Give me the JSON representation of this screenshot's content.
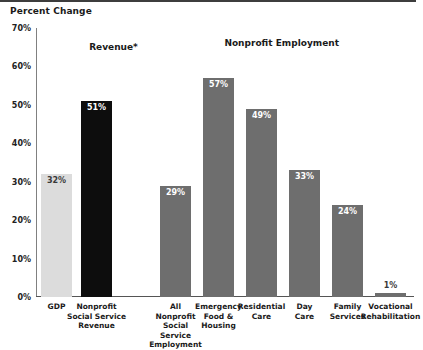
{
  "chart": {
    "title": "Percent Change",
    "type": "bar"
  },
  "chart_data": {
    "type": "bar",
    "title": "Percent Change",
    "xlabel": "",
    "ylabel": "Percent Change",
    "ylim": [
      0,
      70
    ],
    "ytick_labels": [
      "0%",
      "10%",
      "20%",
      "30%",
      "40%",
      "50%",
      "60%",
      "70%"
    ],
    "ytick_values": [
      0,
      10,
      20,
      30,
      40,
      50,
      60,
      70
    ],
    "grid": false,
    "legend_position": "none",
    "group_headers": [
      {
        "label": "Revenue*",
        "center_pct": 20.5
      },
      {
        "label": "Nonprofit Employment",
        "center_pct": 65.0
      }
    ],
    "groups": [
      {
        "name": "Revenue*",
        "bars": [
          {
            "category": "GDP",
            "value": 32,
            "label": "32%",
            "color": "#dcdcdc",
            "label_color": "#3a3a3a",
            "label_placement": "inside"
          },
          {
            "category": "Nonprofit Social Service Revenue",
            "value": 51,
            "label": "51%",
            "color": "#0d0d0d",
            "label_color": "#ffffff",
            "label_placement": "inside"
          }
        ]
      },
      {
        "name": "Nonprofit Employment",
        "bars": [
          {
            "category": "All Nonprofit Social Service Employment",
            "value": 29,
            "label": "29%",
            "color": "#6e6e6e",
            "label_color": "#ffffff",
            "label_placement": "inside"
          },
          {
            "category": "Emergency Food & Housing",
            "value": 57,
            "label": "57%",
            "color": "#6e6e6e",
            "label_color": "#ffffff",
            "label_placement": "inside"
          },
          {
            "category": "Residential Care",
            "value": 49,
            "label": "49%",
            "color": "#6e6e6e",
            "label_color": "#ffffff",
            "label_placement": "inside"
          },
          {
            "category": "Day Care",
            "value": 33,
            "label": "33%",
            "color": "#6e6e6e",
            "label_color": "#ffffff",
            "label_placement": "inside"
          },
          {
            "category": "Family Services",
            "value": 24,
            "label": "24%",
            "color": "#6e6e6e",
            "label_color": "#ffffff",
            "label_placement": "inside"
          },
          {
            "category": "Vocational Rehabilitation",
            "value": 1,
            "label": "1%",
            "color": "#6e6e6e",
            "label_color": "#3a3a3a",
            "label_placement": "above"
          }
        ]
      }
    ],
    "categories": [
      "GDP",
      "Nonprofit Social Service Revenue",
      "All Nonprofit Social Service Employment",
      "Emergency Food & Housing",
      "Residential Care",
      "Day Care",
      "Family Services",
      "Vocational Rehabilitation"
    ],
    "values": [
      32,
      51,
      29,
      57,
      49,
      33,
      24,
      1
    ],
    "colors": [
      "#dcdcdc",
      "#0d0d0d",
      "#6e6e6e",
      "#6e6e6e",
      "#6e6e6e",
      "#6e6e6e",
      "#6e6e6e",
      "#6e6e6e"
    ],
    "bar_geometry": [
      {
        "category": "GDP",
        "x": 5,
        "width": 31,
        "label_lines": [
          "GDP"
        ]
      },
      {
        "category": "Nonprofit Social Service Revenue",
        "x": 45,
        "width": 31,
        "label_lines": [
          "Nonprofit",
          "Social Service",
          "Revenue"
        ]
      },
      {
        "category": "All Nonprofit Social Service Employment",
        "x": 124,
        "width": 31,
        "label_lines": [
          "All",
          "Nonprofit",
          "Social",
          "Service",
          "Employment"
        ]
      },
      {
        "category": "Emergency Food & Housing",
        "x": 167,
        "width": 31,
        "label_lines": [
          "Emergency",
          "Food &",
          "Housing"
        ]
      },
      {
        "category": "Residential Care",
        "x": 210,
        "width": 31,
        "label_lines": [
          "Residential",
          "Care"
        ]
      },
      {
        "category": "Day Care",
        "x": 253,
        "width": 31,
        "label_lines": [
          "Day",
          "Care"
        ]
      },
      {
        "category": "Family Services",
        "x": 296,
        "width": 31,
        "label_lines": [
          "Family",
          "Services"
        ]
      },
      {
        "category": "Vocational Rehabilitation",
        "x": 339,
        "width": 31,
        "label_lines": [
          "Vocational",
          "Rehabilitation"
        ]
      }
    ]
  }
}
